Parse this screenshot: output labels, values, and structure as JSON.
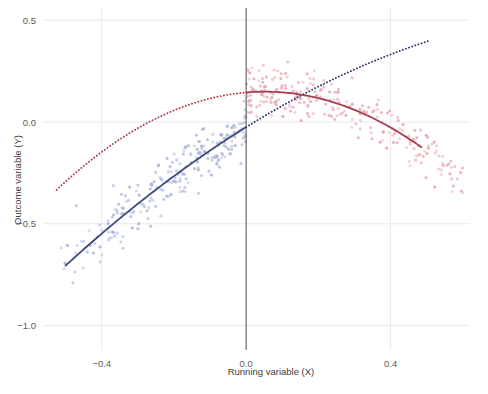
{
  "figure": {
    "name": "regression-discontinuity-plot",
    "background": "#ffffff"
  },
  "chart_data": {
    "type": "scatter",
    "title": "",
    "subtitle": "",
    "xlabel": "Running variable (X)",
    "ylabel": "Outcome variable (Y)",
    "xlim": [
      -0.56,
      0.62
    ],
    "ylim": [
      -1.12,
      0.56
    ],
    "xticks": [
      -0.4,
      0.0,
      0.4
    ],
    "xticklabels": [
      "−0.4",
      "0.0",
      "0.4"
    ],
    "yticks": [
      0.5,
      0.0,
      -0.5,
      -1.0
    ],
    "yticklabels": [
      "0.5",
      "0.0",
      "−0.5",
      "−1.0"
    ],
    "grid": true,
    "grid_color": "#e9e9ec",
    "legend": "none",
    "cutoff": {
      "x": 0.0,
      "label": "",
      "color": "#6e6e72"
    },
    "colors": {
      "left_points": "#a9b3da",
      "right_points": "#e8a2ae",
      "left_fit": "#3d4a7a",
      "right_fit": "#a73f52",
      "left_counterfactual": "#b03a4a",
      "right_counterfactual": "#2f3a66"
    },
    "series": [
      {
        "name": "Control group (X < 0)",
        "type": "scatter",
        "color": "#a9b3da",
        "n_points": 230,
        "x_range": [
          -0.52,
          0.0
        ],
        "y_range": [
          -1.02,
          0.12
        ]
      },
      {
        "name": "Treatment group (X > 0)",
        "type": "scatter",
        "color": "#e8a2ae",
        "n_points": 250,
        "x_range": [
          0.0,
          0.6
        ],
        "y_range": [
          -0.3,
          0.42
        ]
      },
      {
        "name": "Fitted quadratic, left of cutoff",
        "type": "line",
        "style": "solid",
        "color": "#3d4a7a",
        "x": [
          -0.5,
          -0.4,
          -0.3,
          -0.2,
          -0.1,
          0.0
        ],
        "y": [
          -0.575,
          -0.445,
          -0.325,
          -0.215,
          -0.115,
          -0.025
        ]
      },
      {
        "name": "Fitted quadratic, right of cutoff",
        "type": "line",
        "style": "solid",
        "color": "#a73f52",
        "x": [
          0.0,
          0.1,
          0.2,
          0.3,
          0.4,
          0.48
        ],
        "y": [
          0.145,
          0.14,
          0.1,
          0.03,
          -0.075,
          -0.185
        ]
      },
      {
        "name": "Counterfactual extrapolation of left fit",
        "type": "line",
        "style": "dotted",
        "color": "#b03a4a",
        "x": [
          -0.52,
          -0.4,
          -0.3,
          -0.2,
          -0.1,
          0.0
        ],
        "y": [
          -0.215,
          -0.105,
          -0.025,
          0.042,
          0.098,
          0.145
        ]
      },
      {
        "name": "Counterfactual extrapolation of right fit",
        "type": "line",
        "style": "dotted",
        "color": "#2f3a66",
        "x": [
          0.0,
          0.1,
          0.2,
          0.3,
          0.4,
          0.5
        ],
        "y": [
          -0.025,
          0.01,
          0.048,
          0.086,
          0.128,
          0.172
        ]
      }
    ],
    "annotations": []
  }
}
